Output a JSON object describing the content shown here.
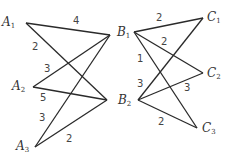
{
  "graph": {
    "left": {
      "nodes": [
        {
          "id": "A1",
          "name": "A",
          "sub": "1",
          "x": 26,
          "y": 23,
          "lx": 2,
          "ly": 16
        },
        {
          "id": "A2",
          "name": "A",
          "sub": "2",
          "x": 33,
          "y": 87,
          "lx": 12,
          "ly": 80
        },
        {
          "id": "A3",
          "name": "A",
          "sub": "3",
          "x": 35,
          "y": 147,
          "lx": 16,
          "ly": 140
        },
        {
          "id": "B1",
          "name": "B",
          "sub": "1",
          "x": 110,
          "y": 35
        },
        {
          "id": "B2",
          "name": "B",
          "sub": "2",
          "x": 107,
          "y": 100
        }
      ],
      "edges": [
        {
          "from": "A1",
          "to": "B1",
          "weight": "4",
          "wx": 73,
          "wy": 16
        },
        {
          "from": "A1",
          "to": "B2",
          "weight": "2",
          "wx": 32,
          "wy": 42
        },
        {
          "from": "A2",
          "to": "B1",
          "weight": "3",
          "wx": 44,
          "wy": 64
        },
        {
          "from": "A2",
          "to": "B2",
          "weight": "5",
          "wx": 40,
          "wy": 93
        },
        {
          "from": "A3",
          "to": "B1",
          "weight": "3",
          "wx": 39,
          "wy": 113
        },
        {
          "from": "A3",
          "to": "B2",
          "weight": "2",
          "wx": 66,
          "wy": 134
        }
      ]
    },
    "right": {
      "nodes": [
        {
          "id": "B1",
          "name": "B",
          "sub": "1",
          "x": 134,
          "y": 32,
          "lx": 117,
          "ly": 26
        },
        {
          "id": "B2",
          "name": "B",
          "sub": "2",
          "x": 138,
          "y": 100,
          "lx": 118,
          "ly": 94
        },
        {
          "id": "C1",
          "name": "C",
          "sub": "1",
          "x": 203,
          "y": 18,
          "lx": 207,
          "ly": 11
        },
        {
          "id": "C2",
          "name": "C",
          "sub": "2",
          "x": 203,
          "y": 73,
          "lx": 207,
          "ly": 67
        },
        {
          "id": "C3",
          "name": "C",
          "sub": "3",
          "x": 197,
          "y": 128,
          "lx": 202,
          "ly": 122
        }
      ],
      "edges": [
        {
          "from": "B1",
          "to": "C1",
          "weight": "2",
          "wx": 156,
          "wy": 13
        },
        {
          "from": "B1",
          "to": "C2",
          "weight": "2",
          "wx": 161,
          "wy": 37
        },
        {
          "from": "B1",
          "to": "C3",
          "weight": "1",
          "wx": 137,
          "wy": 54
        },
        {
          "from": "B2",
          "to": "C1",
          "weight": "3",
          "wx": 137,
          "wy": 79
        },
        {
          "from": "B2",
          "to": "C2",
          "weight": "3",
          "wx": 184,
          "wy": 83
        },
        {
          "from": "B2",
          "to": "C3",
          "weight": "2",
          "wx": 158,
          "wy": 117
        }
      ]
    }
  }
}
